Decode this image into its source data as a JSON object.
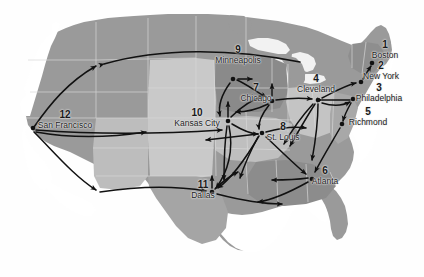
{
  "figure": {
    "type": "map-network-diagram",
    "background_color": "#ffffff",
    "land_color": "#9a9a9a",
    "land_light_color": "#c9c9c9",
    "land_mid_color": "#b0b0b0",
    "land_dark_color": "#8a8a8a",
    "border_color": "#d8d8d8",
    "arrow_color": "#111111",
    "node_color": "#111111",
    "label_color": "#1d1d1d"
  },
  "cities": [
    {
      "id": 1,
      "number": "1",
      "name": "Boston",
      "node_x": 372,
      "node_y": 63,
      "label_x": 385,
      "label_y": 40
    },
    {
      "id": 2,
      "number": "2",
      "name": "New York",
      "node_x": 361,
      "node_y": 82,
      "label_x": 381,
      "label_y": 61
    },
    {
      "id": 3,
      "number": "3",
      "name": "Philadelphia",
      "node_x": 353,
      "node_y": 99,
      "label_x": 379,
      "label_y": 83
    },
    {
      "id": 5,
      "number": "5",
      "name": "Richmond",
      "node_x": 342,
      "node_y": 124,
      "label_x": 368,
      "label_y": 107
    },
    {
      "id": 4,
      "number": "4",
      "name": "Cleveland",
      "node_x": 318,
      "node_y": 100,
      "label_x": 316,
      "label_y": 74
    },
    {
      "id": 6,
      "number": "6",
      "name": "Atlanta",
      "node_x": 312,
      "node_y": 179,
      "label_x": 325,
      "label_y": 166
    },
    {
      "id": 7,
      "number": "7",
      "name": "Chicago",
      "node_x": 272,
      "node_y": 101,
      "label_x": 256,
      "label_y": 83
    },
    {
      "id": 8,
      "number": "8",
      "name": "St. Louis",
      "node_x": 262,
      "node_y": 133,
      "label_x": 283,
      "label_y": 122
    },
    {
      "id": 9,
      "number": "9",
      "name": "Minneapolis",
      "node_x": 233,
      "node_y": 79,
      "label_x": 238,
      "label_y": 45
    },
    {
      "id": 10,
      "number": "10",
      "name": "Kansas City",
      "node_x": 228,
      "node_y": 121,
      "label_x": 197,
      "label_y": 108
    },
    {
      "id": 11,
      "number": "11",
      "name": "Dallas",
      "node_x": 212,
      "node_y": 192,
      "label_x": 203,
      "label_y": 180
    },
    {
      "id": 12,
      "number": "12",
      "name": "San Francisco",
      "node_x": 33,
      "node_y": 128,
      "label_x": 65,
      "label_y": 110
    }
  ],
  "routes": [
    {
      "from": "San Francisco",
      "to": "Seattle",
      "direction": "one-way"
    },
    {
      "from": "San Francisco",
      "to": "Kansas City",
      "direction": "one-way"
    },
    {
      "from": "San Francisco",
      "to": "Dallas",
      "direction": "one-way"
    },
    {
      "from": "Seattle",
      "to": "Minneapolis",
      "direction": "one-way"
    },
    {
      "from": "Minneapolis",
      "to": "Chicago",
      "direction": "one-way"
    },
    {
      "from": "Minneapolis",
      "to": "Kansas City",
      "direction": "one-way"
    },
    {
      "from": "Kansas City",
      "to": "Chicago",
      "direction": "one-way"
    },
    {
      "from": "Kansas City",
      "to": "St. Louis",
      "direction": "one-way"
    },
    {
      "from": "Kansas City",
      "to": "Dallas",
      "direction": "one-way"
    },
    {
      "from": "Chicago",
      "to": "Cleveland",
      "direction": "one-way"
    },
    {
      "from": "Chicago",
      "to": "St. Louis",
      "direction": "one-way"
    },
    {
      "from": "Cleveland",
      "to": "New York",
      "direction": "one-way"
    },
    {
      "from": "Cleveland",
      "to": "Philadelphia",
      "direction": "one-way"
    },
    {
      "from": "Cleveland",
      "to": "Atlanta",
      "direction": "one-way"
    },
    {
      "from": "New York",
      "to": "Boston",
      "direction": "one-way"
    },
    {
      "from": "Philadelphia",
      "to": "Richmond",
      "direction": "one-way"
    },
    {
      "from": "Richmond",
      "to": "Atlanta",
      "direction": "one-way"
    },
    {
      "from": "St. Louis",
      "to": "Atlanta",
      "direction": "one-way"
    },
    {
      "from": "St. Louis",
      "to": "Dallas",
      "direction": "one-way"
    },
    {
      "from": "Atlanta",
      "to": "Dallas",
      "direction": "one-way"
    },
    {
      "from": "Dallas",
      "to": "Atlanta",
      "direction": "one-way"
    }
  ]
}
